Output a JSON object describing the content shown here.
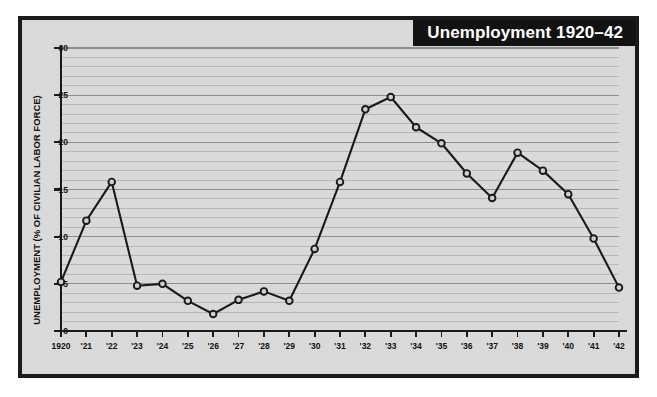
{
  "figure": {
    "title": "Unemployment 1920–42",
    "background_color": "#d9d9d9",
    "frame_color": "#1b1b1b",
    "title_banner_color": "#121212",
    "title_text_color": "#ffffff",
    "line_color": "#1a1a1a",
    "marker_fill": "#d0d0d0",
    "gridline_minor_color": "#b7b7b7",
    "gridline_major_color": "#8e8e8e"
  },
  "chart_data": {
    "type": "line",
    "title": "Unemployment 1920–42",
    "xlabel": "",
    "ylabel": "UNEMPLOYMENT (% OF CIVILIAN LABOR FORCE)",
    "ylim": [
      0,
      30
    ],
    "yticks": [
      0,
      5,
      10,
      15,
      20,
      25,
      30
    ],
    "ytick_labels": [
      "0",
      "5",
      "10",
      "15",
      "20",
      "25",
      "30"
    ],
    "grid": true,
    "grid_minor_step": 1,
    "grid_major_step": 5,
    "legend": null,
    "x": [
      1920,
      1921,
      1922,
      1923,
      1924,
      1925,
      1926,
      1927,
      1928,
      1929,
      1930,
      1931,
      1932,
      1933,
      1934,
      1935,
      1936,
      1937,
      1938,
      1939,
      1940,
      1941,
      1942
    ],
    "xtick_labels": [
      "1920",
      "'21",
      "'22",
      "'23",
      "'24",
      "'25",
      "'26",
      "'27",
      "'28",
      "'29",
      "'30",
      "'31",
      "'32",
      "'33",
      "'34",
      "'35",
      "'36",
      "'37",
      "'38",
      "'39",
      "'40",
      "'41",
      "'42"
    ],
    "categories": [
      "1920",
      "'21",
      "'22",
      "'23",
      "'24",
      "'25",
      "'26",
      "'27",
      "'28",
      "'29",
      "'30",
      "'31",
      "'32",
      "'33",
      "'34",
      "'35",
      "'36",
      "'37",
      "'38",
      "'39",
      "'40",
      "'41",
      "'42"
    ],
    "values": [
      5.2,
      11.7,
      15.8,
      4.8,
      5.0,
      3.2,
      1.8,
      3.3,
      4.2,
      3.2,
      8.7,
      15.8,
      23.5,
      24.8,
      21.6,
      19.9,
      16.7,
      14.1,
      18.9,
      17.0,
      14.5,
      9.8,
      4.6
    ],
    "series": [
      {
        "name": "Unemployment rate",
        "values": [
          5.2,
          11.7,
          15.8,
          4.8,
          5.0,
          3.2,
          1.8,
          3.3,
          4.2,
          3.2,
          8.7,
          15.8,
          23.5,
          24.8,
          21.6,
          19.9,
          16.7,
          14.1,
          18.9,
          17.0,
          14.5,
          9.8,
          4.6
        ]
      }
    ]
  }
}
